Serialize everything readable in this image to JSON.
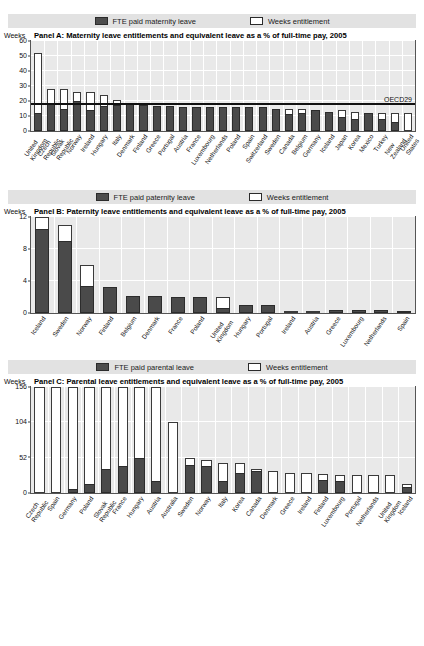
{
  "legend": {
    "maternity": {
      "fte_label": "FTE paid maternity leave",
      "weeks_label": "Weeks entitlement"
    },
    "paternity": {
      "fte_label": "FTE paid paternity leave",
      "weeks_label": "Weeks entitlement"
    },
    "parental": {
      "fte_label": "FTE paid parental leave",
      "weeks_label": "Weeks entitlement"
    }
  },
  "axis_word": "Weeks",
  "panelA": {
    "title": "Panel A:  Maternity leave entitlements and equivalent leave as a % of full-time pay, 2005"
  },
  "panelB": {
    "title": "Panel B: Paternity leave entitlements and equivalent leave as a % of full-time pay, 2005"
  },
  "panelC": {
    "title": "Panel C:  Parental leave entitlements and equivalent leave as a % of full-time pay, 2005"
  },
  "annotations": {
    "oecd_average": "OECD29"
  },
  "chart_data": [
    {
      "type": "bar",
      "id": "panel-a",
      "title": "Panel A:  Maternity leave entitlements and equivalent leave as a % of full-time pay, 2005",
      "xlabel": "",
      "ylabel": "Weeks",
      "ylim": [
        0,
        60
      ],
      "yticks": [
        0,
        10,
        20,
        30,
        40,
        50,
        60
      ],
      "grid": true,
      "legend_position": "top",
      "annotation": {
        "label": "OECD29",
        "type": "average-line",
        "value": 17.4
      },
      "categories": [
        "United Kingdom",
        "Czech Republic",
        "Slovak Republic",
        "Norway",
        "Ireland",
        "Hungary",
        "Italy",
        "Denmark",
        "Finland",
        "Greece",
        "Portugal",
        "Austria",
        "France",
        "Luxembourg",
        "Netherlands",
        "Poland",
        "Spain",
        "Switzerland",
        "Sweden",
        "Canada",
        "Belgium",
        "Germany",
        "Iceland",
        "Japan",
        "Korea",
        "Mexico",
        "Turkey",
        "New Zealand",
        "United States"
      ],
      "series": [
        {
          "name": "Weeks entitlement",
          "values": [
            52,
            28,
            28,
            26,
            26,
            24,
            21,
            18,
            17.5,
            17,
            17,
            16,
            16,
            16,
            16,
            16,
            16,
            16,
            15,
            15,
            15,
            14,
            13,
            14,
            12.5,
            12,
            12,
            12,
            12
          ]
        },
        {
          "name": "FTE paid maternity leave",
          "values": [
            12,
            19,
            15,
            20,
            14,
            17,
            17.5,
            18,
            17.5,
            17,
            17,
            16,
            16,
            16,
            16,
            16,
            16,
            16,
            15,
            11.5,
            12,
            14,
            13,
            9.3,
            8.3,
            12,
            8,
            6,
            0
          ]
        }
      ]
    },
    {
      "type": "bar",
      "id": "panel-b",
      "title": "Panel B: Paternity leave entitlements and equivalent leave as a % of full-time pay, 2005",
      "xlabel": "",
      "ylabel": "Weeks",
      "ylim": [
        0,
        12
      ],
      "yticks": [
        0,
        4,
        8,
        12
      ],
      "grid": true,
      "legend_position": "top",
      "categories": [
        "Iceland",
        "Sweden",
        "Norway",
        "Finland",
        "Belgium",
        "Denmark",
        "France",
        "Poland",
        "United Kingdom",
        "Hungary",
        "Portugal",
        "Ireland",
        "Austria",
        "Greece",
        "Luxembourg",
        "Netherlands",
        "Spain"
      ],
      "series": [
        {
          "name": "Weeks entitlement",
          "values": [
            12,
            11,
            6,
            3.3,
            2.1,
            2.1,
            2,
            2,
            2,
            1,
            1,
            0,
            0,
            0.4,
            0.4,
            0.4,
            0.3
          ]
        },
        {
          "name": "FTE paid paternity leave",
          "values": [
            10.5,
            9,
            3.4,
            3.3,
            2.1,
            2.1,
            2,
            2,
            0.6,
            1,
            1,
            0,
            0,
            0.4,
            0.4,
            0.4,
            0.3
          ]
        }
      ]
    },
    {
      "type": "bar",
      "id": "panel-c",
      "title": "Panel C:  Parental leave entitlements and equivalent leave as a % of full-time pay, 2005",
      "xlabel": "",
      "ylabel": "Weeks",
      "ylim": [
        0,
        156
      ],
      "yticks": [
        0,
        52,
        104,
        156
      ],
      "grid": true,
      "legend_position": "top",
      "categories": [
        "Czech Republic",
        "Spain",
        "Germany",
        "Poland",
        "Slovak Republic",
        "France",
        "Hungary",
        "Austria",
        "Australia",
        "Sweden",
        "Norway",
        "Italy",
        "Korea",
        "Canada",
        "Denmark",
        "Greece",
        "Ireland",
        "Finland",
        "Luxembourg",
        "Portugal",
        "Netherlands",
        "United Kingdom",
        "Iceland"
      ],
      "series": [
        {
          "name": "Weeks entitlement",
          "values": [
            156,
            156,
            156,
            156,
            156,
            156,
            156,
            156,
            104,
            52,
            48,
            44,
            44,
            35,
            32,
            30,
            30,
            28,
            26,
            26,
            26,
            26,
            13
          ]
        },
        {
          "name": "FTE paid parental leave",
          "values": [
            0,
            0,
            6,
            13,
            36,
            40,
            52,
            18,
            0,
            41,
            40,
            17,
            30,
            33,
            0,
            0,
            0,
            19,
            17,
            0,
            0,
            0,
            9
          ]
        }
      ]
    }
  ]
}
